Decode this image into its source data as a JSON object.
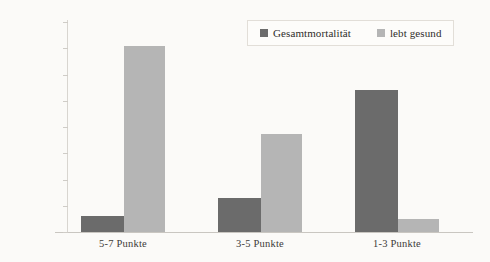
{
  "chart_data": {
    "type": "bar",
    "title": "",
    "xlabel": "",
    "ylabel": "",
    "categories": [
      "5-7 Punkte",
      "3-5 Punkte",
      "1-3 Punkte"
    ],
    "series": [
      {
        "name": "Gesamtmortalität",
        "color": "#6b6b6b",
        "values": [
          6,
          13,
          54
        ]
      },
      {
        "name": "lebt gesund",
        "color": "#b5b5b5",
        "values": [
          71,
          37.5,
          5
        ]
      }
    ],
    "ylim": [
      0,
      80
    ],
    "ytick_values": [
      80,
      70,
      60,
      50,
      40,
      30,
      20,
      10,
      0
    ],
    "ytick_labels": [
      "80%",
      "70%",
      "60%",
      "50%",
      "40%",
      "30%",
      "20%",
      "10%",
      "0%"
    ],
    "grid": false,
    "legend_position": "top-right"
  },
  "legend": {
    "entries": [
      {
        "label": "Gesamtmortalität",
        "swatch": "dark"
      },
      {
        "label": "lebt gesund",
        "swatch": "light"
      }
    ]
  },
  "axis": {
    "y_ticks": [
      "80%",
      "70%",
      "60%",
      "50%",
      "40%",
      "30%",
      "20%",
      "10%",
      "0%"
    ],
    "x_categories": [
      "5-7 Punkte",
      "3-5 Punkte",
      "1-3 Punkte"
    ]
  },
  "colors": {
    "background": "#fbfaf8",
    "series_dark": "#6b6b6b",
    "series_light": "#b5b5b5",
    "axis_line": "#cfccc7",
    "text": "#3d3a38"
  }
}
